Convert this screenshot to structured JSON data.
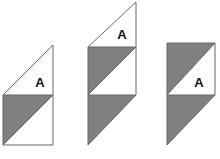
{
  "page": {
    "background_color": "#ffffff",
    "width": 220,
    "height": 159
  },
  "style": {
    "fill_gray": "#808080",
    "fill_white": "#ffffff",
    "stroke_color": "#666666",
    "stroke_width": 1,
    "label_color": "#111111"
  },
  "figures": [
    {
      "id": "figure-1",
      "name": "left-figure",
      "label": "A",
      "label_x": 40,
      "label_y": 84,
      "outline": "3,95 3,145 53,145 53,45",
      "parts": [
        {
          "id": "figure-1-top-triangle",
          "name": "white-triangle-top",
          "shade": "white",
          "points": "3,95 53,45 53,95"
        },
        {
          "id": "figure-1-bottom-gray-triangle",
          "name": "gray-triangle-upper-left",
          "shade": "gray",
          "points": "3,95 53,95 3,145"
        },
        {
          "id": "figure-1-bottom-white-triangle",
          "name": "white-triangle-lower-right",
          "shade": "white",
          "points": "53,95 53,145 3,145"
        }
      ],
      "edges": [
        "3,95 53,45",
        "53,45 53,95",
        "3,95 53,95",
        "3,95 3,145",
        "3,145 53,145",
        "53,95 53,145",
        "3,145 53,95"
      ]
    },
    {
      "id": "figure-2",
      "name": "middle-figure",
      "label": "A",
      "label_x": 122,
      "label_y": 36,
      "outline": "88,47 136,2 136,95 88,95 88,145",
      "parts": [
        {
          "id": "figure-2-top-triangle",
          "name": "white-triangle-top",
          "shade": "white",
          "points": "88,47 136,2 136,47"
        },
        {
          "id": "figure-2-middle-gray-triangle",
          "name": "gray-triangle-upper-left",
          "shade": "gray",
          "points": "88,47 136,47 88,95"
        },
        {
          "id": "figure-2-middle-white-triangle",
          "name": "white-triangle-lower-right",
          "shade": "white",
          "points": "136,47 136,95 88,95"
        },
        {
          "id": "figure-2-bottom-gray-triangle",
          "name": "gray-triangle-bottom",
          "shade": "gray",
          "points": "88,95 136,95 88,145"
        }
      ],
      "edges": [
        "88,47 136,2",
        "136,2 136,47",
        "88,47 136,47",
        "88,47 88,95",
        "88,95 136,95",
        "136,47 136,95",
        "88,95 136,47",
        "88,95 88,145",
        "88,145 136,95"
      ]
    },
    {
      "id": "figure-3",
      "name": "right-figure",
      "label": "A",
      "label_x": 199,
      "label_y": 84,
      "outline": "167,43 215,43 215,95 167,95 167,145",
      "parts": [
        {
          "id": "figure-3-top-gray-triangle",
          "name": "gray-triangle-upper-left",
          "shade": "gray",
          "points": "167,43 215,43 167,95"
        },
        {
          "id": "figure-3-top-white-triangle",
          "name": "white-triangle-lower-right",
          "shade": "white",
          "points": "215,43 215,95 167,95"
        },
        {
          "id": "figure-3-bottom-gray-triangle",
          "name": "gray-triangle-bottom",
          "shade": "gray",
          "points": "167,95 215,95 167,145"
        }
      ],
      "edges": [
        "167,43 215,43",
        "215,43 215,95",
        "167,43 167,95",
        "167,95 215,95",
        "167,95 215,43",
        "167,95 167,145",
        "167,145 215,95"
      ]
    }
  ]
}
